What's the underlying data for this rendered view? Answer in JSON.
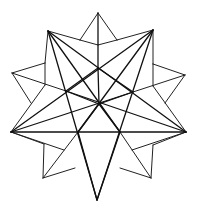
{
  "figure": {
    "style": "black line drawing on white",
    "colors": {
      "line": "#111111",
      "background": "#ffffff"
    }
  }
}
